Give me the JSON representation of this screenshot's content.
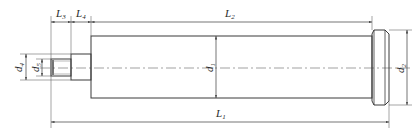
{
  "diagram": {
    "type": "technical-drawing",
    "colors": {
      "line": "#3a3a3a",
      "thin": "#6a6a6a",
      "background": "#ffffff"
    },
    "dimensions": {
      "L1": {
        "base": "L",
        "sub": "1"
      },
      "L2": {
        "base": "L",
        "sub": "2"
      },
      "L3": {
        "base": "L",
        "sub": "3"
      },
      "L4": {
        "base": "L",
        "sub": "4"
      },
      "d1": {
        "base": "d",
        "sub": "1"
      },
      "d2": {
        "base": "d",
        "sub": "2"
      },
      "d4": {
        "base": "d",
        "sub": "4"
      },
      "d5": {
        "base": "d",
        "sub": "5"
      }
    }
  }
}
